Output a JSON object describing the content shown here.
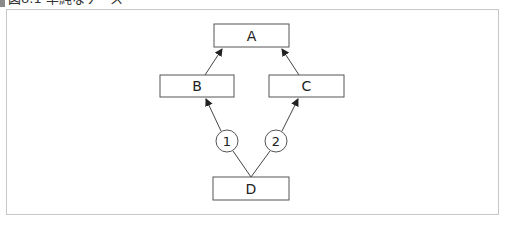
{
  "title": "図8.1 単純なケース",
  "nodes": [
    {
      "id": "A",
      "label": "A",
      "x": 214,
      "y": 24,
      "w": 75,
      "h": 23
    },
    {
      "id": "B",
      "label": "B",
      "x": 160,
      "y": 75,
      "w": 74,
      "h": 22
    },
    {
      "id": "C",
      "label": "C",
      "x": 269,
      "y": 75,
      "w": 75,
      "h": 22
    },
    {
      "id": "D",
      "label": "D",
      "x": 213,
      "y": 177,
      "w": 76,
      "h": 23
    }
  ],
  "markers": [
    {
      "id": "1",
      "label": "1",
      "cx": 227,
      "cy": 141,
      "r": 11
    },
    {
      "id": "2",
      "label": "2",
      "cx": 276,
      "cy": 141,
      "r": 11
    }
  ],
  "edges": [
    {
      "from": "B",
      "to": "A"
    },
    {
      "from": "C",
      "to": "A"
    },
    {
      "from": "D",
      "to": "B",
      "via": "1"
    },
    {
      "from": "D",
      "to": "C",
      "via": "2"
    }
  ]
}
